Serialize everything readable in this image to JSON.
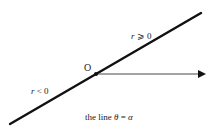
{
  "diagram": {
    "title": "the line θ = α",
    "caption": {
      "prefix": "the line ",
      "theta": "θ",
      "equals": " = ",
      "alpha": "α"
    },
    "origin_label": "O",
    "positive_ray_label": {
      "var": "r",
      "rel": " ⩾ 0"
    },
    "negative_ray_label": {
      "var": "r",
      "rel": " < 0"
    },
    "colors": {
      "line": "#111111",
      "axis": "#333333",
      "text": "#222222",
      "background": "#ffffff"
    },
    "geometry": {
      "line_start": [
        10,
        124
      ],
      "line_end": [
        201,
        13
      ],
      "origin": [
        96,
        74
      ],
      "axis_end": [
        206,
        74
      ]
    }
  }
}
